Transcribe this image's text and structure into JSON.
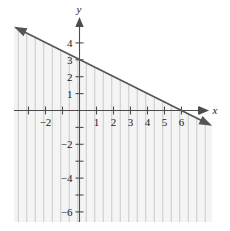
{
  "chart_data": {
    "type": "line",
    "title": "",
    "subtitle": "",
    "xlabel": "x",
    "ylabel": "y",
    "xlim": [
      -3.7,
      8.0
    ],
    "ylim": [
      -7.2,
      5.2
    ],
    "grid": false,
    "legend": null,
    "x_ticks": [
      -3,
      -2,
      -1,
      1,
      2,
      3,
      4,
      5,
      6,
      7
    ],
    "x_tick_labels": [
      "",
      "-2",
      "",
      "1",
      "2",
      "3",
      "4",
      "5",
      "6",
      ""
    ],
    "y_ticks": [
      -6,
      -5,
      -4,
      -3,
      -2,
      -1,
      1,
      2,
      3,
      4
    ],
    "y_tick_labels": [
      "-6",
      "",
      "-4",
      "",
      "-2",
      "",
      "1",
      "2",
      "3",
      "4"
    ],
    "x_labeled": [
      {
        "value": -2,
        "label": "-2"
      },
      {
        "value": 1,
        "label": "1"
      },
      {
        "value": 2,
        "label": "2"
      },
      {
        "value": 3,
        "label": "3"
      },
      {
        "value": 4,
        "label": "4"
      },
      {
        "value": 5,
        "label": "5"
      },
      {
        "value": 6,
        "label": "6"
      }
    ],
    "y_labeled": [
      {
        "value": 4,
        "label": "4"
      },
      {
        "value": 3,
        "label": "3"
      },
      {
        "value": 2,
        "label": "2"
      },
      {
        "value": 1,
        "label": "1"
      },
      {
        "value": -2,
        "label": "-2"
      },
      {
        "value": -4,
        "label": "-4"
      },
      {
        "value": -6,
        "label": "-6"
      }
    ],
    "series": [
      {
        "name": "boundary",
        "equation": "y = 3 - x/2",
        "slope": -0.5,
        "y_intercept": 3,
        "x_intercept": 6,
        "style": "solid",
        "arrows_both_ends": true,
        "points": [
          [
            -3.7,
            4.85
          ],
          [
            8.0,
            -1.0
          ]
        ]
      }
    ],
    "shaded_region": {
      "description": "region below and including the boundary line",
      "inequality": "y <= 3 - x/2",
      "hatch": "vertical",
      "hatch_spacing_units": 0.5,
      "fill_color": "#f4f4f4",
      "hatch_color": "#c2c2c2"
    },
    "colors": {
      "axis": "#4d4d4d",
      "boundary": "#555555",
      "hatch": "#c2c2c2",
      "fill": "#f4f4f4",
      "background": "#ffffff",
      "text": "#1a1a1a"
    }
  }
}
